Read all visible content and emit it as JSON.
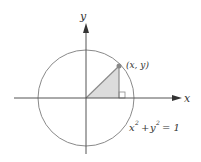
{
  "diagram": {
    "labels": {
      "y_axis": "y",
      "x_axis": "x",
      "point": "(x, y)",
      "equation_x": "x",
      "equation_y": "y",
      "equation_sup": "2",
      "equation_rest": "= 1",
      "plus": "+"
    },
    "colors": {
      "axis": "#444444",
      "circle": "#888888",
      "triangle_fill": "#d9d9d9",
      "triangle_stroke": "#999999",
      "point": "#888888"
    }
  }
}
